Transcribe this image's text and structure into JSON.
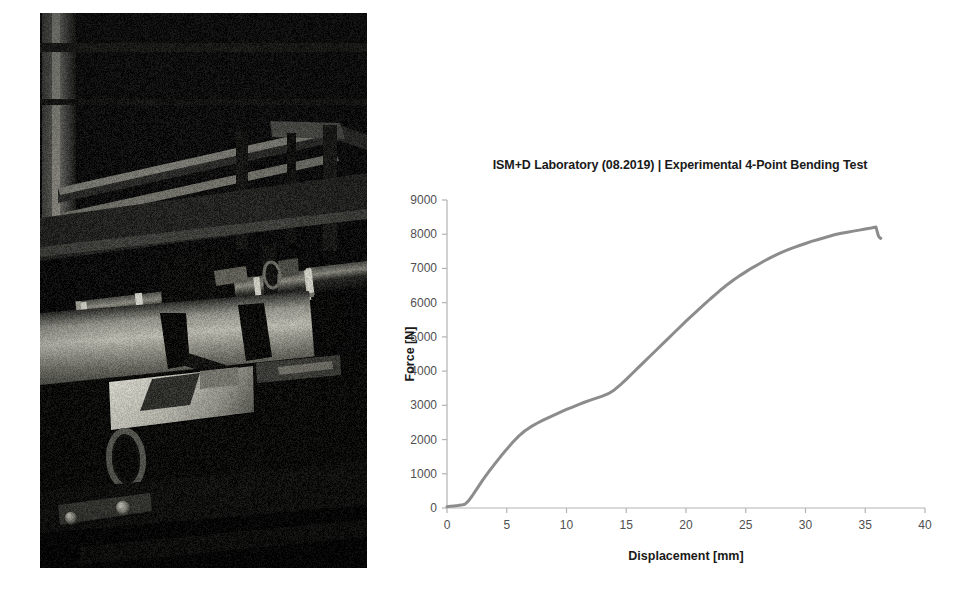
{
  "figure": {
    "photo": {
      "caption_alt": "Experimental 4-point bending test rig photograph",
      "description": "Dark laboratory photograph of a steel 4-point bending test frame with horizontal loading rollers clamped on a large cylindrical pipe specimen",
      "icon": "photograph-icon"
    }
  },
  "chart_data": {
    "type": "line",
    "title": "ISM+D Laboratory (08.2019) | Experimental 4-Point Bending Test",
    "xlabel": "Displacement [mm]",
    "ylabel": "Force [N]",
    "xlim": [
      0,
      40
    ],
    "ylim": [
      0,
      9000
    ],
    "xticks": [
      0,
      5,
      10,
      15,
      20,
      25,
      30,
      35,
      40
    ],
    "yticks": [
      0,
      1000,
      2000,
      3000,
      4000,
      5000,
      6000,
      7000,
      8000,
      9000
    ],
    "xtick_labels": [
      "0",
      "5",
      "10",
      "15",
      "20",
      "25",
      "30",
      "35",
      "40"
    ],
    "ytick_labels": [
      "0",
      "1000",
      "2000",
      "3000",
      "4000",
      "5000",
      "6000",
      "7000",
      "8000",
      "9000"
    ],
    "grid": false,
    "legend": null,
    "line_color": "#8c8c8c",
    "line_width": 3,
    "series": [
      {
        "name": "Force-displacement",
        "x": [
          0.0,
          0.3,
          0.6,
          0.9,
          1.2,
          1.5,
          1.8,
          2.1,
          2.5,
          3.0,
          3.5,
          4.0,
          4.5,
          5.0,
          5.5,
          6.0,
          6.5,
          7.0,
          7.5,
          8.0,
          8.5,
          9.0,
          9.5,
          10.0,
          10.5,
          11.0,
          11.5,
          12.0,
          12.5,
          13.0,
          13.5,
          14.0,
          14.5,
          15.0,
          15.5,
          16.0,
          16.5,
          17.0,
          17.5,
          18.0,
          18.5,
          19.0,
          19.5,
          20.0,
          20.5,
          21.0,
          21.5,
          22.0,
          22.5,
          23.0,
          23.5,
          24.0,
          24.5,
          25.0,
          25.5,
          26.0,
          26.5,
          27.0,
          27.5,
          28.0,
          28.5,
          29.0,
          29.5,
          30.0,
          30.5,
          31.0,
          31.5,
          32.0,
          32.5,
          33.0,
          33.5,
          34.0,
          34.5,
          35.0,
          35.5,
          35.9,
          36.1,
          36.2,
          36.3
        ],
        "y": [
          40,
          50,
          60,
          70,
          85,
          110,
          210,
          350,
          560,
          820,
          1060,
          1290,
          1510,
          1720,
          1920,
          2100,
          2250,
          2370,
          2470,
          2560,
          2640,
          2720,
          2800,
          2880,
          2950,
          3020,
          3090,
          3150,
          3210,
          3270,
          3340,
          3450,
          3600,
          3760,
          3930,
          4100,
          4270,
          4440,
          4610,
          4780,
          4950,
          5120,
          5290,
          5460,
          5620,
          5780,
          5940,
          6100,
          6250,
          6400,
          6540,
          6670,
          6790,
          6900,
          7010,
          7110,
          7210,
          7300,
          7390,
          7470,
          7540,
          7610,
          7670,
          7730,
          7790,
          7840,
          7890,
          7940,
          7990,
          8030,
          8060,
          8090,
          8120,
          8150,
          8180,
          8210,
          7950,
          7900,
          7880
        ]
      }
    ],
    "annotations": [
      {
        "label": "peak force",
        "x": 35.9,
        "y": 8210
      },
      {
        "label": "slope change",
        "x": 13.6,
        "y": 3370
      }
    ]
  }
}
